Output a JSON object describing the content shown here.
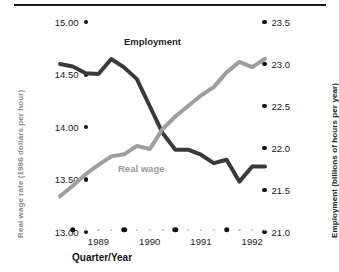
{
  "chart_data": {
    "type": "line",
    "title": "",
    "xlabel": "Quarter/Year",
    "grid": false,
    "legend_position": "inline-annotation",
    "x": [
      "1988Q4",
      "1989Q1",
      "1989Q2",
      "1989Q3",
      "1989Q4",
      "1990Q1",
      "1990Q2",
      "1990Q3",
      "1990Q4",
      "1991Q1",
      "1991Q2",
      "1991Q3",
      "1991Q4",
      "1992Q1",
      "1992Q2",
      "1992Q3",
      "1992Q4"
    ],
    "x_major_ticks": [
      "1989",
      "1990",
      "1991",
      "1992"
    ],
    "minor_ticks_per_year": 3,
    "axes": {
      "left": {
        "label": "Real wage rate (1986 dollars per hour)",
        "ticks": [
          "15.00",
          "14.50",
          "14.00",
          "13.50",
          "13.00"
        ],
        "values": [
          15.0,
          14.5,
          14.0,
          13.5,
          13.0
        ],
        "ylim": [
          13.0,
          15.0
        ],
        "color": "#8c8c8c"
      },
      "right": {
        "label": "Employment (billions of hours per year)",
        "ticks": [
          "23.5",
          "23.0",
          "22.5",
          "22.0",
          "21.5",
          "21.0"
        ],
        "values": [
          23.5,
          23.0,
          22.5,
          22.0,
          21.5,
          21.0
        ],
        "ylim": [
          21.0,
          23.5
        ],
        "color": "#232323"
      }
    },
    "series": [
      {
        "name": "Employment",
        "label": "Employment",
        "axis": "right",
        "color": "#3a3a3a",
        "unit": "billions of hours per year",
        "values": [
          23.0,
          22.97,
          22.89,
          22.88,
          23.06,
          22.96,
          22.82,
          22.5,
          22.18,
          21.98,
          21.98,
          21.92,
          21.82,
          21.86,
          21.6,
          21.78,
          21.78
        ]
      },
      {
        "name": "Real wage",
        "label": "Real wage",
        "axis": "left",
        "color": "#9e9e9e",
        "unit": "1986 dollars per hour",
        "values": [
          13.34,
          13.44,
          13.55,
          13.64,
          13.72,
          13.74,
          13.82,
          13.79,
          13.98,
          14.1,
          14.2,
          14.3,
          14.38,
          14.52,
          14.62,
          14.57,
          14.65
        ]
      }
    ]
  }
}
